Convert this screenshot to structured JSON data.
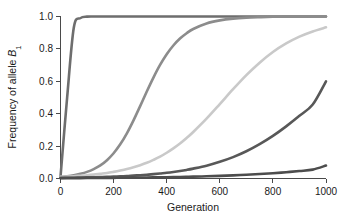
{
  "chart_data": {
    "type": "line",
    "title": "",
    "xlabel": "Generation",
    "ylabel_prefix": "Frequency of allele ",
    "ylabel_symbol": "B",
    "ylabel_subscript": "1",
    "ylabel_full": "Frequency of allele B1",
    "xlim": [
      0,
      1000
    ],
    "ylim": [
      0.0,
      1.0
    ],
    "xticks": [
      0,
      200,
      400,
      600,
      800,
      1000
    ],
    "xtick_labels": [
      "0",
      "200",
      "400",
      "600",
      "800",
      "1000"
    ],
    "yticks": [
      0.0,
      0.2,
      0.4,
      0.6,
      0.8,
      1.0
    ],
    "ytick_labels": [
      "0.0",
      "0.2",
      "0.4",
      "0.6",
      "0.8",
      "1.0"
    ],
    "grid": false,
    "legend": "none",
    "axis_color": "#4a4a4a",
    "x": [
      0,
      25,
      50,
      75,
      100,
      125,
      150,
      175,
      200,
      225,
      250,
      275,
      300,
      325,
      350,
      375,
      400,
      425,
      450,
      475,
      500,
      550,
      600,
      650,
      700,
      750,
      800,
      850,
      900,
      950,
      1000
    ],
    "series": [
      {
        "name": "curve-1",
        "color": "#6e6e6e",
        "linewidth": 2.6,
        "midpoint_generation": 22,
        "values": [
          0.01,
          0.5,
          0.93,
          0.99,
          0.999,
          1.0,
          1.0,
          1.0,
          1.0,
          1.0,
          1.0,
          1.0,
          1.0,
          1.0,
          1.0,
          1.0,
          1.0,
          1.0,
          1.0,
          1.0,
          1.0,
          1.0,
          1.0,
          1.0,
          1.0,
          1.0,
          1.0,
          1.0,
          1.0,
          1.0,
          1.0
        ]
      },
      {
        "name": "curve-2",
        "color": "#8c8c8c",
        "linewidth": 2.6,
        "midpoint_generation": 240,
        "values": [
          0.01,
          0.014,
          0.02,
          0.029,
          0.041,
          0.058,
          0.081,
          0.113,
          0.156,
          0.211,
          0.279,
          0.359,
          0.447,
          0.537,
          0.623,
          0.701,
          0.767,
          0.821,
          0.864,
          0.897,
          0.923,
          0.957,
          0.976,
          0.987,
          0.993,
          0.996,
          0.998,
          0.999,
          0.999,
          1.0,
          1.0
        ]
      },
      {
        "name": "curve-3",
        "color": "#c9c9c9",
        "linewidth": 2.6,
        "midpoint_generation": 460,
        "values": [
          0.01,
          0.012,
          0.014,
          0.017,
          0.02,
          0.024,
          0.029,
          0.034,
          0.041,
          0.049,
          0.058,
          0.069,
          0.082,
          0.097,
          0.115,
          0.135,
          0.159,
          0.186,
          0.216,
          0.25,
          0.287,
          0.369,
          0.459,
          0.551,
          0.638,
          0.715,
          0.781,
          0.834,
          0.876,
          0.908,
          0.933
        ]
      },
      {
        "name": "curve-4",
        "color": "#585858",
        "linewidth": 2.6,
        "endpoint_value": 0.6,
        "values": [
          0.004,
          0.005,
          0.005,
          0.006,
          0.007,
          0.008,
          0.009,
          0.01,
          0.012,
          0.013,
          0.015,
          0.018,
          0.02,
          0.023,
          0.027,
          0.031,
          0.035,
          0.04,
          0.046,
          0.053,
          0.061,
          0.079,
          0.103,
          0.132,
          0.168,
          0.212,
          0.263,
          0.322,
          0.387,
          0.457,
          0.6
        ]
      },
      {
        "name": "curve-5",
        "color": "#4d4d4d",
        "linewidth": 2.6,
        "endpoint_value": 0.08,
        "values": [
          0.002,
          0.0022,
          0.0024,
          0.0026,
          0.0028,
          0.0031,
          0.0034,
          0.0037,
          0.004,
          0.0044,
          0.0048,
          0.0052,
          0.0057,
          0.0062,
          0.0068,
          0.0074,
          0.0081,
          0.0088,
          0.0096,
          0.0105,
          0.0114,
          0.0136,
          0.0162,
          0.0193,
          0.023,
          0.0274,
          0.0326,
          0.0388,
          0.0461,
          0.0548,
          0.08
        ]
      }
    ]
  }
}
